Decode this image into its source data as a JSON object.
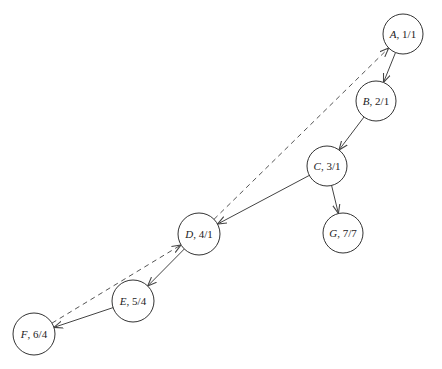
{
  "diagram": {
    "type": "directed-graph",
    "style": {
      "background": "#ffffff",
      "stroke": "#333333",
      "node_fill": "#ffffff"
    },
    "nodes": [
      {
        "id": "A",
        "name": "A",
        "value": "1/1",
        "cx": 403,
        "cy": 34,
        "r": 20
      },
      {
        "id": "B",
        "name": "B",
        "value": "2/1",
        "cx": 376,
        "cy": 101,
        "r": 20
      },
      {
        "id": "C",
        "name": "C",
        "value": "3/1",
        "cx": 327,
        "cy": 166,
        "r": 20
      },
      {
        "id": "D",
        "name": "D",
        "value": "4/1",
        "cx": 199,
        "cy": 234,
        "r": 21
      },
      {
        "id": "E",
        "name": "E",
        "value": "5/4",
        "cx": 133,
        "cy": 301,
        "r": 21
      },
      {
        "id": "F",
        "name": "F",
        "value": "6/4",
        "cx": 34,
        "cy": 334,
        "r": 21
      },
      {
        "id": "G",
        "name": "G",
        "value": "7/7",
        "cx": 343,
        "cy": 233,
        "r": 20
      }
    ],
    "edges": [
      {
        "from": "A",
        "to": "B",
        "style": "solid"
      },
      {
        "from": "B",
        "to": "C",
        "style": "solid"
      },
      {
        "from": "C",
        "to": "D",
        "style": "solid"
      },
      {
        "from": "C",
        "to": "G",
        "style": "solid"
      },
      {
        "from": "D",
        "to": "E",
        "style": "solid"
      },
      {
        "from": "E",
        "to": "F",
        "style": "solid"
      },
      {
        "from": "F",
        "to": "D",
        "style": "dashed"
      },
      {
        "from": "D",
        "to": "A",
        "style": "dashed"
      }
    ]
  }
}
